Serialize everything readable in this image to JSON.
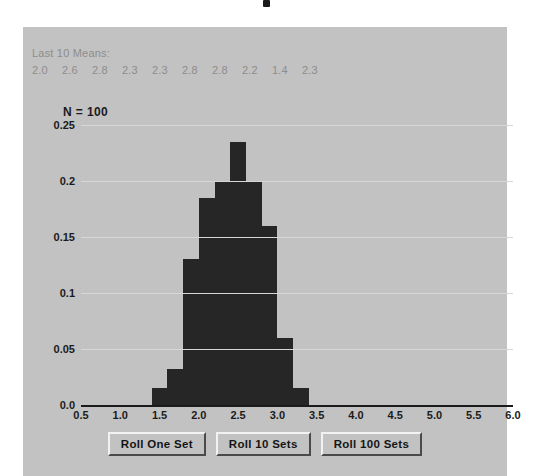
{
  "panel": {
    "background_color": "#c2c2c2",
    "bar_color": "#262626",
    "grid_color": "#d7d7d7",
    "muted_text_color": "#8d8d8d"
  },
  "header": {
    "means_title": "Last 10 Means:",
    "means_values": [
      "2.0",
      "2.6",
      "2.8",
      "2.3",
      "2.3",
      "2.8",
      "2.8",
      "2.2",
      "1.4",
      "2.3"
    ],
    "n_label": "N = 100"
  },
  "buttons": [
    {
      "label": "Roll One Set",
      "name": "roll-one-set-button"
    },
    {
      "label": "Roll 10 Sets",
      "name": "roll-10-sets-button"
    },
    {
      "label": "Roll 100 Sets",
      "name": "roll-100-sets-button"
    }
  ],
  "chart_data": {
    "type": "bar",
    "title": "",
    "subtitle": "",
    "xlabel": "",
    "ylabel": "",
    "grid": true,
    "legend": "none",
    "xlim": [
      0.5,
      6.0
    ],
    "ylim": [
      0.0,
      0.25
    ],
    "bin_width": 0.2,
    "xticks": [
      "0.5",
      "1.0",
      "1.5",
      "2.0",
      "2.5",
      "3.0",
      "3.5",
      "4.0",
      "4.5",
      "5.0",
      "5.5",
      "6.0"
    ],
    "xtick_values": [
      0.5,
      1.0,
      1.5,
      2.0,
      2.5,
      3.0,
      3.5,
      4.0,
      4.5,
      5.0,
      5.5,
      6.0
    ],
    "yticks": [
      "0.0",
      "0.05",
      "0.1",
      "0.15",
      "0.2",
      "0.25"
    ],
    "ytick_values": [
      0.0,
      0.05,
      0.1,
      0.15,
      0.2,
      0.25
    ],
    "bin_left_edges": [
      1.4,
      1.6,
      1.8,
      2.0,
      2.2,
      2.4,
      2.6,
      2.8,
      3.0,
      3.2
    ],
    "categories": [
      "1.4",
      "1.6",
      "1.8",
      "2.0",
      "2.2",
      "2.4",
      "2.6",
      "2.8",
      "3.0",
      "3.2"
    ],
    "values": [
      0.015,
      0.032,
      0.13,
      0.185,
      0.2,
      0.235,
      0.2,
      0.16,
      0.06,
      0.015
    ]
  }
}
